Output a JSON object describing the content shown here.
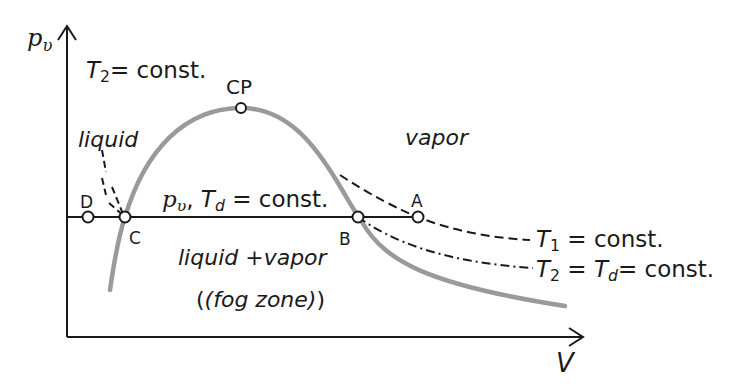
{
  "axes": {
    "y_label": "p",
    "y_label_sub": "υ",
    "x_label": "V"
  },
  "regions": {
    "liquid": "liquid",
    "vapor": "vapor",
    "mixed": "liquid +vapor",
    "mixed_note": "(fog zone)"
  },
  "points": {
    "critical": "CP",
    "A": "A",
    "B": "B",
    "C": "C",
    "D": "D"
  },
  "isobar_label": {
    "p": "p",
    "p_sub": "υ",
    "sep": ", ",
    "T": "T",
    "T_sub": "d",
    "rest": " = const."
  },
  "isotherms": {
    "t2_left": {
      "T": "T",
      "sub": "2",
      "rest": "= const."
    },
    "t1": {
      "T": "T",
      "sub": "1",
      "rest": " = const."
    },
    "t2_right": {
      "T": "T",
      "sub": "2",
      "mid": " = ",
      "T2": "T",
      "sub2": "d",
      "rest": "= const."
    }
  },
  "colors": {
    "axis": "#1a1a1a",
    "saturation_curve": "#999999",
    "line": "#1a1a1a"
  }
}
